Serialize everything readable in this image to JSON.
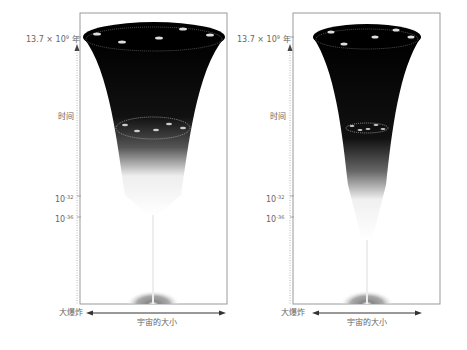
{
  "diagram": {
    "type": "cosmic-expansion-funnels",
    "panels": [
      {
        "id": "left",
        "top_label": "13.7 × 10⁹ 年",
        "top_label_base": "13.7 × 10",
        "top_label_exp": "9",
        "top_label_unit": " 年",
        "time_label": "时间",
        "tick1_base": "10",
        "tick1_exp": "-32",
        "tick2_base": "10",
        "tick2_exp": "-36",
        "origin_label": "大爆炸",
        "x_axis_label": "宇宙的大小"
      },
      {
        "id": "right",
        "top_label": "13.7 × 10⁹ 年",
        "top_label_base": "13.7 × 10",
        "top_label_exp": "9",
        "top_label_unit": " 年",
        "time_label": "时间",
        "tick1_base": "10",
        "tick1_exp": "-32",
        "tick2_base": "10",
        "tick2_exp": "-36",
        "origin_label": "大爆炸",
        "x_axis_label": "宇宙的大小"
      }
    ],
    "colors": {
      "funnel_dark": "#000000",
      "frame": "#999999",
      "label": "#666666",
      "background": "#ffffff"
    }
  }
}
